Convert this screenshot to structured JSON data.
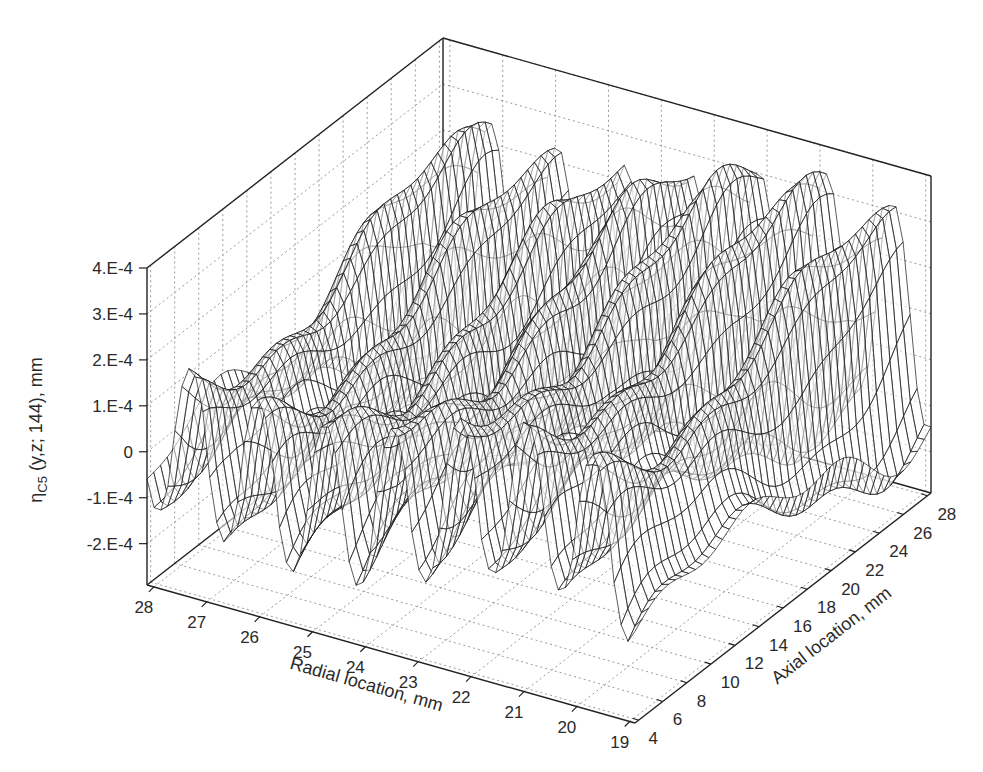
{
  "chart_data": {
    "type": "surface3d",
    "title": "",
    "style": "wireframe mesh, grayscale",
    "zlabel": {
      "main": "η",
      "sub": "C5",
      "rest": " (y,z; 144), mm"
    },
    "xlabel": "Radial location, mm",
    "ylabel": "Axial location, mm",
    "x_ticks": [
      "28",
      "27",
      "26",
      "25",
      "24",
      "23",
      "22",
      "21",
      "20",
      "19"
    ],
    "x_range": [
      28.13,
      18.9
    ],
    "y_ticks": [
      "4",
      "6",
      "8",
      "10",
      "12",
      "14",
      "16",
      "18",
      "20",
      "22",
      "24",
      "26",
      "28"
    ],
    "y_range": [
      3.7,
      28.3
    ],
    "z_ticks": [
      "-2.E-4",
      "-1.E-4",
      "0",
      "1.E-4",
      "2.E-4",
      "3.E-4",
      "4.E-4"
    ],
    "z_tick_values": [
      -0.0002,
      -0.0001,
      0,
      0.0001,
      0.0002,
      0.0003,
      0.0004
    ],
    "z_range": [
      -0.00029,
      0.0004
    ],
    "grid": true,
    "approx_surface": {
      "description": "Periodic ridges along radial direction (~1 mm period) with amplitude varying along axial direction; peaks up to ~4.6E-4, valleys down to ~-2.5E-4",
      "ridge_peaks_radial_mm": [
        27.3,
        25.9,
        24.6,
        23.4,
        22.1,
        20.9,
        19.6
      ],
      "max_value": 0.00046,
      "min_value": -0.00025
    }
  },
  "box": {
    "back_top": [
      442,
      40
    ],
    "left_top": [
      145,
      268
    ],
    "left_bottom": [
      147,
      585
    ],
    "front_bottom": [
      635,
      723
    ],
    "right_bottom": [
      931,
      493
    ],
    "right_top": [
      931,
      178
    ],
    "back_bottom": [
      442,
      357
    ]
  }
}
